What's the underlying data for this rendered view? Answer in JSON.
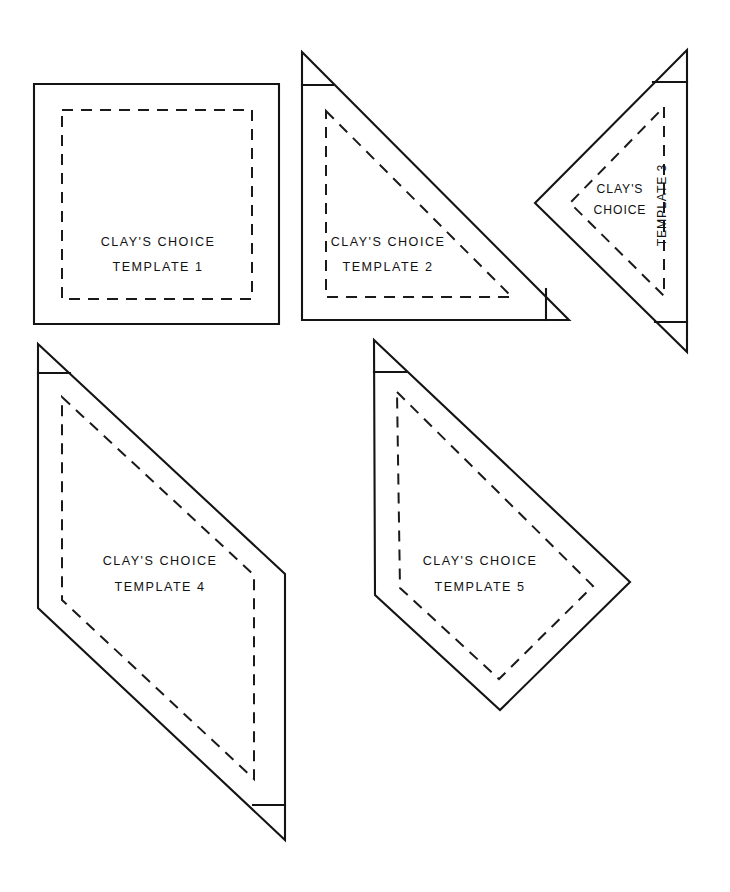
{
  "page": {
    "background_color": "#ffffff",
    "ink_color": "#141414",
    "width": 730,
    "height": 892
  },
  "legend": {
    "cut_line_style": "solid",
    "seam_line_style": "dashed",
    "brand_label": "CLAY'S CHOICE"
  },
  "templates": [
    {
      "id": "template-1",
      "shape": "square",
      "brand_label": "CLAY'S CHOICE",
      "number_label": "TEMPLATE  1",
      "cut_path": "M 34 84 L 279 84 L 279 324 L 34 324 Z",
      "seam_path": "M 62 110 L 252 110 L 252 299 L 62 299 Z",
      "blunt_paths": [],
      "brand_text": {
        "x": 158,
        "y": 243,
        "rotate": 0
      },
      "number_text": {
        "x": 158,
        "y": 268,
        "rotate": 0
      }
    },
    {
      "id": "template-2",
      "shape": "right-triangle",
      "brand_label": "CLAY'S CHOICE",
      "number_label": "TEMPLATE 2",
      "cut_path": "M 302 52 L 569 320 L 302 320 Z",
      "seam_path": "M 326 111 L 512 297 L 326 297 Z",
      "blunt_paths": [
        "M 302 85 L 333 85",
        "M 546 289 L 546 320"
      ],
      "brand_text": {
        "x": 388,
        "y": 243,
        "rotate": 0
      },
      "number_text": {
        "x": 388,
        "y": 268,
        "rotate": 0
      }
    },
    {
      "id": "template-3",
      "shape": "triangle-pointing-left",
      "brand_label_line1": "CLAY'S",
      "brand_label_line2": "CHOICE",
      "number_label": "TEMPLATE 3",
      "cut_path": "M 687 50 L 687 352 L 535 203 Z",
      "seam_path": "M 664 107 L 664 296 L 570 203 Z",
      "blunt_paths": [
        "M 653 82 L 687 82",
        "M 655 322 L 687 322"
      ],
      "brand_text": {
        "x": 620,
        "y": 190,
        "rotate": 0
      },
      "brand_text2": {
        "x": 620,
        "y": 211,
        "rotate": 0
      },
      "number_text": {
        "x": 663,
        "y": 205,
        "rotate": -90
      }
    },
    {
      "id": "template-4",
      "shape": "parallelogram",
      "brand_label": "CLAY'S CHOICE",
      "number_label": "TEMPLATE  4",
      "cut_path": "M 38 344 L 285 574 L 285 840 L 38 608 Z",
      "seam_path": "M 62 397 L 254 575 L 254 779 L 62 600 Z",
      "blunt_paths": [
        "M 38 373 L 70 373",
        "M 253 805 L 285 805"
      ],
      "brand_text": {
        "x": 160,
        "y": 562,
        "rotate": 0
      },
      "number_text": {
        "x": 160,
        "y": 588,
        "rotate": 0
      }
    },
    {
      "id": "template-5",
      "shape": "kite",
      "brand_label": "CLAY'S CHOICE",
      "number_label": "TEMPLATE  5",
      "cut_path": "M 374 340 L 630 582 L 500 710 L 375 595 L 374 340 Z",
      "seam_path": "M 397 392 L 593 586 L 499 679 L 400 588 L 397 392 Z",
      "blunt_paths": [
        "M 374 372 L 406 372"
      ],
      "brand_text": {
        "x": 480,
        "y": 562,
        "rotate": 0
      },
      "number_text": {
        "x": 480,
        "y": 588,
        "rotate": 0
      }
    }
  ]
}
